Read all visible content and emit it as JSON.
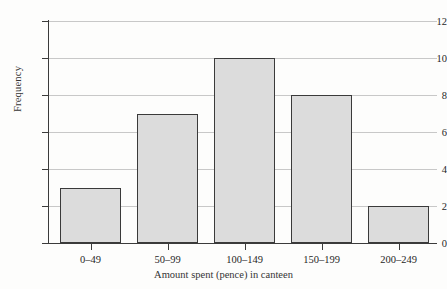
{
  "chart_data": {
    "type": "bar",
    "title": "",
    "subtitle": "",
    "categories": [
      "0–49",
      "50–99",
      "100–149",
      "150–199",
      "200–249"
    ],
    "values": [
      3,
      7,
      10,
      8,
      2
    ],
    "xlabel": "Amount spent (pence) in canteen",
    "ylabel": "Frequency",
    "ylim": [
      0,
      12
    ],
    "yticks": [
      0,
      2,
      4,
      6,
      8,
      10,
      12
    ],
    "ytick_labels": [
      "0",
      "2",
      "4",
      "6",
      "8",
      "10",
      "12"
    ],
    "grid": "horizontal",
    "legend": "none",
    "bar_fill_color": "#dcdcdc",
    "bar_border_color": "#3a3a3a",
    "gridline_color": "#c8c8c8",
    "axis_color": "#3b3b3b",
    "background_color": "#fdfdfc"
  }
}
